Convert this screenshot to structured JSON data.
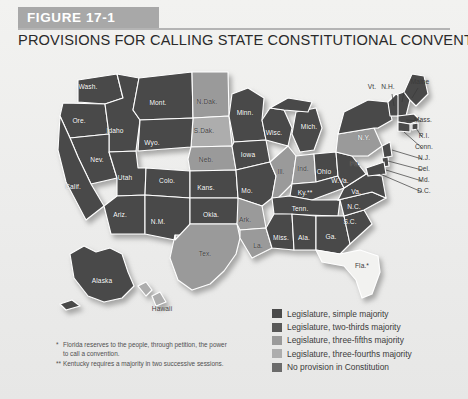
{
  "figure": {
    "banner_label": "FIGURE 17-1",
    "title": "PROVISIONS FOR CALLING STATE CONSTITUTIONAL CONVENTIONS"
  },
  "colors": {
    "simple_majority": "#4a4a4a",
    "two_thirds": "#6e6e6e",
    "three_fifths": "#8f8f8f",
    "three_fourths": "#c9c9c9",
    "no_provision": "#7a7a7a",
    "banner": "#a8a8a8",
    "page_bg": "#ececeb"
  },
  "legend": {
    "items": [
      {
        "label": "Legislature, simple majority",
        "color": "#4a4a4a"
      },
      {
        "label": "Legislature, two-thirds majority",
        "color": "#585858"
      },
      {
        "label": "Legislature, three-fifths majority",
        "color": "#9a9a9a"
      },
      {
        "label": "Legislature, three-fourths majority",
        "color": "#adadad"
      },
      {
        "label": "No provision in Constitution",
        "color": "#6b6b6b"
      }
    ]
  },
  "footnotes": [
    {
      "marker": "*",
      "line1": "Florida reserves to the people, through petition, the power",
      "line2": "to call a convention."
    },
    {
      "marker": "**",
      "line1": "Kentucky requires a majority in two successive sessions.",
      "line2": ""
    }
  ],
  "map": {
    "states": [
      {
        "name": "Wash.",
        "x": 88,
        "y": 28
      },
      {
        "name": "Ore.",
        "x": 79,
        "y": 62
      },
      {
        "name": "Idaho",
        "x": 115,
        "y": 72
      },
      {
        "name": "Mont.",
        "x": 158,
        "y": 44
      },
      {
        "name": "N.Dak.",
        "x": 207,
        "y": 43
      },
      {
        "name": "Minn.",
        "x": 245,
        "y": 54
      },
      {
        "name": "Wisc.",
        "x": 274,
        "y": 74
      },
      {
        "name": "Mich.",
        "x": 309,
        "y": 68
      },
      {
        "name": "S.Dak.",
        "x": 204,
        "y": 72
      },
      {
        "name": "Wyo.",
        "x": 152,
        "y": 84
      },
      {
        "name": "Nev.",
        "x": 97,
        "y": 101
      },
      {
        "name": "Calif.",
        "x": 73,
        "y": 128
      },
      {
        "name": "Utah",
        "x": 125,
        "y": 119
      },
      {
        "name": "Colo.",
        "x": 167,
        "y": 122
      },
      {
        "name": "Neb.",
        "x": 206,
        "y": 101
      },
      {
        "name": "Iowa",
        "x": 248,
        "y": 96
      },
      {
        "name": "Ill.",
        "x": 281,
        "y": 113
      },
      {
        "name": "Ind.",
        "x": 303,
        "y": 110
      },
      {
        "name": "Ohio",
        "x": 324,
        "y": 113
      },
      {
        "name": "Pa.",
        "x": 355,
        "y": 105
      },
      {
        "name": "N.Y.",
        "x": 364,
        "y": 79
      },
      {
        "name": "Kans.",
        "x": 206,
        "y": 129
      },
      {
        "name": "Mo.",
        "x": 247,
        "y": 132
      },
      {
        "name": "Ky.**",
        "x": 305,
        "y": 134
      },
      {
        "name": "W.Va.",
        "x": 340,
        "y": 122
      },
      {
        "name": "Va.",
        "x": 356,
        "y": 133
      },
      {
        "name": "Ariz.",
        "x": 120,
        "y": 156
      },
      {
        "name": "N.M.",
        "x": 158,
        "y": 163
      },
      {
        "name": "Okla.",
        "x": 211,
        "y": 156
      },
      {
        "name": "Ark.",
        "x": 245,
        "y": 161
      },
      {
        "name": "Tenn.",
        "x": 300,
        "y": 150
      },
      {
        "name": "N.C.",
        "x": 354,
        "y": 148
      },
      {
        "name": "S.C.",
        "x": 350,
        "y": 163
      },
      {
        "name": "Miss.",
        "x": 281,
        "y": 179
      },
      {
        "name": "Ala.",
        "x": 304,
        "y": 179
      },
      {
        "name": "Ga.",
        "x": 331,
        "y": 178
      },
      {
        "name": "La.",
        "x": 258,
        "y": 187
      },
      {
        "name": "Tex.",
        "x": 205,
        "y": 195
      },
      {
        "name": "Fla.*",
        "x": 362,
        "y": 207
      },
      {
        "name": "Alaska",
        "x": 102,
        "y": 222
      },
      {
        "name": "Hawaii",
        "x": 162,
        "y": 250
      }
    ],
    "callouts": [
      {
        "name": "Vt.",
        "x": 372,
        "y": 28
      },
      {
        "name": "N.H.",
        "x": 388,
        "y": 28
      },
      {
        "name": "Maine",
        "x": 420,
        "y": 23
      },
      {
        "name": "Mass.",
        "x": 423,
        "y": 61
      },
      {
        "name": "R.I.",
        "x": 424,
        "y": 77
      },
      {
        "name": "Conn.",
        "x": 424,
        "y": 88
      },
      {
        "name": "N.J.",
        "x": 424,
        "y": 99
      },
      {
        "name": "Del.",
        "x": 424,
        "y": 110
      },
      {
        "name": "Md.",
        "x": 424,
        "y": 121
      },
      {
        "name": "D.C.",
        "x": 424,
        "y": 132
      }
    ]
  }
}
